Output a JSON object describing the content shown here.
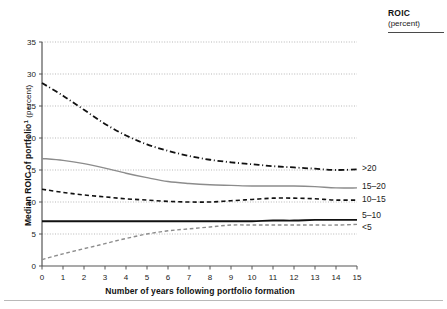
{
  "legend": {
    "title": "ROIC",
    "subtitle": "(percent)"
  },
  "axis": {
    "y_title_main": "Median ROIC of portfolio",
    "y_title_footnote": "1",
    "y_title_unit": "(percent)",
    "x_title": "Number of years following portfolio formation"
  },
  "chart_data": {
    "type": "line",
    "title": "",
    "xlabel": "Number of years following portfolio formation",
    "ylabel": "Median ROIC of portfolio¹ (percent)",
    "xlim": [
      0,
      15
    ],
    "ylim": [
      0,
      35
    ],
    "xticks": [
      0,
      1,
      2,
      3,
      4,
      5,
      6,
      7,
      8,
      9,
      10,
      11,
      12,
      13,
      14,
      15
    ],
    "xtick_labels": [
      "0",
      "1",
      "2",
      "3",
      "4",
      "5",
      "6",
      "7",
      "8",
      "9",
      "10",
      "11",
      "12",
      "13",
      "14",
      "15"
    ],
    "yticks": [
      0,
      5,
      10,
      15,
      20,
      25,
      30,
      35
    ],
    "ytick_labels": [
      "0",
      "5",
      "10",
      "15",
      "20",
      "25",
      "30",
      "35"
    ],
    "grid": "horizontal-dotted",
    "legend_position": "right-of-line-ends",
    "x": [
      0,
      1,
      2,
      3,
      4,
      5,
      6,
      7,
      8,
      9,
      10,
      11,
      12,
      13,
      14,
      15
    ],
    "series": [
      {
        "name": ">20",
        "label": ">20",
        "style": "dash-dot",
        "color": "#111111",
        "width": 1.8,
        "values": [
          28.6,
          26.6,
          24.4,
          22.2,
          20.4,
          19.0,
          18.0,
          17.2,
          16.6,
          16.2,
          15.9,
          15.6,
          15.4,
          15.2,
          15.0,
          15.1
        ]
      },
      {
        "name": "15-20",
        "label": "15–20",
        "style": "solid",
        "color": "#8c8c8c",
        "width": 1.4,
        "values": [
          16.8,
          16.5,
          16.0,
          15.3,
          14.5,
          13.8,
          13.2,
          12.9,
          12.7,
          12.6,
          12.5,
          12.5,
          12.5,
          12.4,
          12.2,
          12.2
        ]
      },
      {
        "name": "10-15",
        "label": "10–15",
        "style": "dashed",
        "color": "#111111",
        "width": 1.6,
        "values": [
          12.0,
          11.5,
          11.1,
          10.8,
          10.5,
          10.3,
          10.1,
          10.0,
          10.0,
          10.2,
          10.4,
          10.6,
          10.6,
          10.5,
          10.3,
          10.3
        ]
      },
      {
        "name": "5-10",
        "label": "5–10",
        "style": "solid",
        "color": "#111111",
        "width": 1.9,
        "values": [
          7.0,
          7.0,
          7.0,
          7.0,
          7.0,
          7.0,
          7.0,
          7.0,
          7.0,
          7.0,
          7.0,
          7.1,
          7.1,
          7.2,
          7.2,
          7.2
        ]
      },
      {
        "name": "<5",
        "label": "<5",
        "style": "dashed",
        "color": "#8c8c8c",
        "width": 1.4,
        "values": [
          1.0,
          1.9,
          2.7,
          3.5,
          4.3,
          5.0,
          5.5,
          5.8,
          6.1,
          6.4,
          6.4,
          6.4,
          6.4,
          6.4,
          6.4,
          6.5
        ]
      }
    ]
  }
}
